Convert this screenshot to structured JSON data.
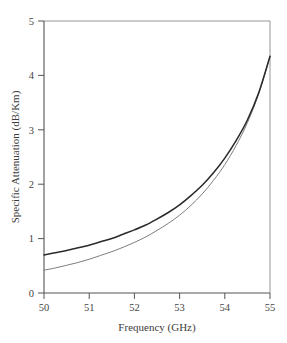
{
  "figure": {
    "background_color": "#ffffff",
    "plot_box": {
      "left": 44,
      "right": 270,
      "top": 21,
      "bottom": 293
    }
  },
  "chart_data": {
    "type": "line",
    "title": "",
    "subtitle": "",
    "xlabel": "Frequency (GHz)",
    "ylabel": "Specific Attenuation (dB/Km)",
    "xlim": [
      50,
      55
    ],
    "ylim": [
      0,
      5
    ],
    "xticks": [
      50,
      51,
      52,
      53,
      54,
      55
    ],
    "xticklabels": [
      "50",
      "51",
      "52",
      "53",
      "54",
      "55"
    ],
    "yticks": [
      0,
      1,
      2,
      3,
      4,
      5
    ],
    "yticklabels": [
      "0",
      "1",
      "2",
      "3",
      "4",
      "5"
    ],
    "grid": false,
    "legend": null,
    "annotations": [],
    "x": [
      50.0,
      50.25,
      50.5,
      50.75,
      51.0,
      51.25,
      51.5,
      51.75,
      52.0,
      52.25,
      52.5,
      52.75,
      53.0,
      53.25,
      53.5,
      53.75,
      54.0,
      54.25,
      54.5,
      54.75,
      55.0
    ],
    "series": [
      {
        "name": "upper-curve",
        "color": "#2b2b2b",
        "linewidth": 1.55,
        "values": [
          0.7,
          0.74,
          0.78,
          0.83,
          0.88,
          0.94,
          1.0,
          1.08,
          1.16,
          1.25,
          1.36,
          1.48,
          1.62,
          1.79,
          1.98,
          2.21,
          2.48,
          2.8,
          3.18,
          3.68,
          4.35
        ]
      },
      {
        "name": "lower-curve",
        "color": "#7d7d7d",
        "linewidth": 1.0,
        "values": [
          0.42,
          0.46,
          0.51,
          0.56,
          0.62,
          0.69,
          0.76,
          0.84,
          0.93,
          1.03,
          1.15,
          1.28,
          1.43,
          1.61,
          1.82,
          2.07,
          2.36,
          2.71,
          3.13,
          3.66,
          4.35
        ]
      }
    ]
  },
  "axes": {
    "x_title": "Frequency (GHz)",
    "y_title": "Specific Attenuation (dB/Km)",
    "x_tick_labels": [
      "50",
      "51",
      "52",
      "53",
      "54",
      "55"
    ],
    "y_tick_labels": [
      "0",
      "1",
      "2",
      "3",
      "4",
      "5"
    ]
  },
  "colors": {
    "axis": "#555555",
    "frame": "#8a8a8a",
    "primary_series": "#2b2b2b",
    "secondary_series": "#7d7d7d",
    "text": "#3c3c3c",
    "background": "#ffffff"
  }
}
